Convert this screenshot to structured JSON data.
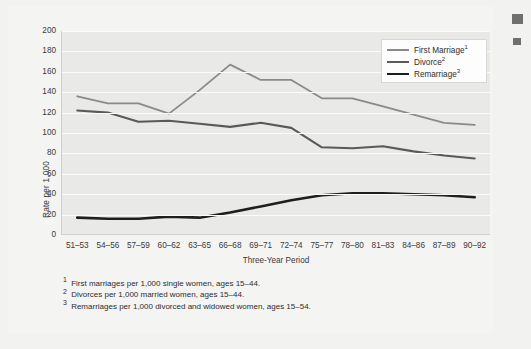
{
  "chart_data": {
    "type": "line",
    "title": "",
    "xlabel": "Three-Year Period",
    "ylabel": "Rate per 1,000",
    "ylim": [
      0,
      200
    ],
    "ytick_step": 20,
    "yticks": [
      200,
      180,
      160,
      140,
      120,
      100,
      80,
      60,
      40,
      20,
      0
    ],
    "grid": true,
    "legend_position": "top-right",
    "categories": [
      "51–53",
      "54–56",
      "57–59",
      "60–62",
      "63–65",
      "66–68",
      "69–71",
      "72–74",
      "75–77",
      "78–80",
      "81–83",
      "84–86",
      "87–89",
      "90–92"
    ],
    "series": [
      {
        "name": "First Marriage",
        "footnote_marker": "1",
        "color": "#8a8a8a",
        "width": 1.8,
        "values": [
          136,
          129,
          129,
          119,
          142,
          167,
          152,
          152,
          134,
          134,
          126,
          118,
          110,
          108
        ]
      },
      {
        "name": "Divorce",
        "footnote_marker": "2",
        "color": "#595959",
        "width": 2.1,
        "values": [
          122,
          120,
          111,
          112,
          109,
          106,
          110,
          105,
          86,
          85,
          87,
          82,
          78,
          75
        ]
      },
      {
        "name": "Remarriage",
        "footnote_marker": "3",
        "color": "#1e1e1e",
        "width": 2.6,
        "values": [
          17,
          16,
          16,
          18,
          17,
          22,
          28,
          34,
          39,
          41,
          41,
          40,
          39,
          37
        ]
      }
    ]
  },
  "axes": {
    "y_title": "Rate per 1,000",
    "x_title": "Three-Year Period"
  },
  "legend": {
    "items": [
      {
        "label": "First Marriage",
        "marker": "1"
      },
      {
        "label": "Divorce",
        "marker": "2"
      },
      {
        "label": "Remarriage",
        "marker": "3"
      }
    ]
  },
  "footnotes": [
    {
      "marker": "1",
      "text": "First marriages per 1,000 single women, ages 15–44."
    },
    {
      "marker": "2",
      "text": "Divorces per 1,000 married women, ages 15–44."
    },
    {
      "marker": "3",
      "text": "Remarriages per 1,000 divorced and widowed women, ages 15–54."
    }
  ],
  "colors": {
    "panel_background": "#e9e9e8",
    "page_background": "#f4f4f3",
    "gridline": "#fbfbfb",
    "first_marriage": "#8a8a8a",
    "divorce": "#595959",
    "remarriage": "#1e1e1e",
    "text": "#2d2d2d"
  }
}
